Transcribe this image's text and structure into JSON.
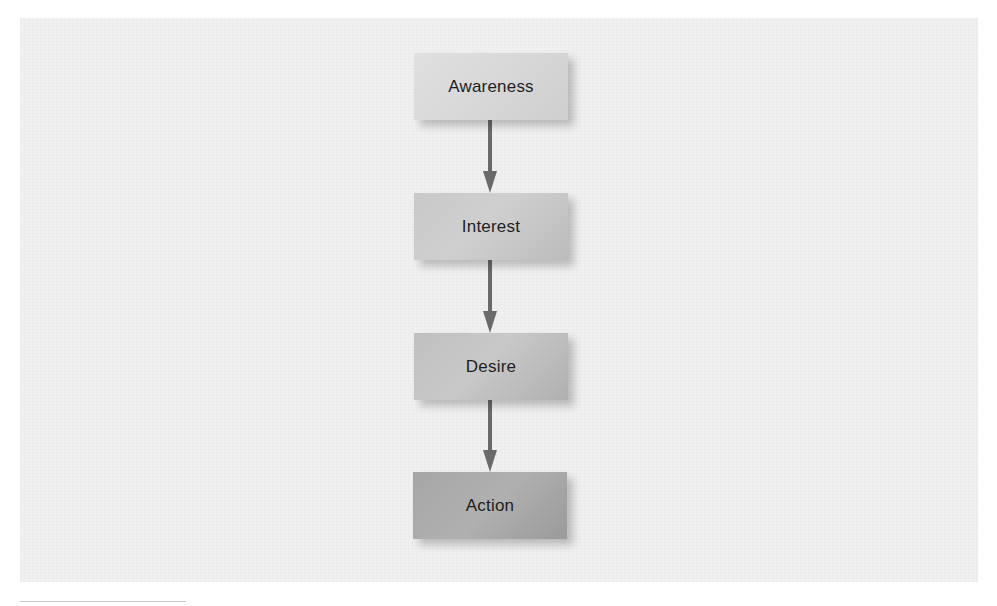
{
  "diagram": {
    "type": "vertical-flowchart",
    "stages": [
      {
        "label": "Awareness",
        "fill_from": "#dedede",
        "fill_to": "#d2d2d2"
      },
      {
        "label": "Interest",
        "fill_from": "#cccccc",
        "fill_to": "#bdbdbd"
      },
      {
        "label": "Desire",
        "fill_from": "#c2c2c2",
        "fill_to": "#b1b1b1"
      },
      {
        "label": "Action",
        "fill_from": "#a9a9a9",
        "fill_to": "#9c9c9c"
      }
    ],
    "connectors": [
      {
        "from": "Awareness",
        "to": "Interest"
      },
      {
        "from": "Interest",
        "to": "Desire"
      },
      {
        "from": "Desire",
        "to": "Action"
      }
    ],
    "colors": {
      "panel_background": "#f0f0f0",
      "page_background": "#ffffff",
      "arrow": "#6a6a6a",
      "text": "#1e1e1e"
    }
  }
}
